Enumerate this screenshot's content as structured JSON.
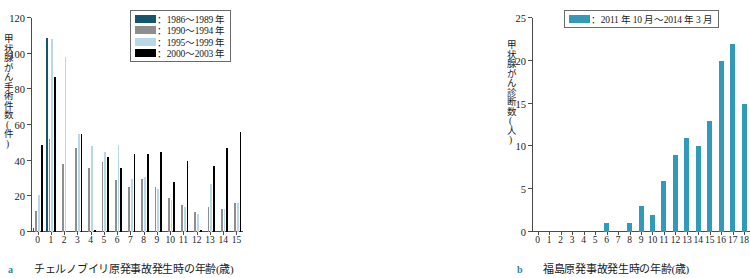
{
  "figure": {
    "panels": [
      {
        "tag": "a",
        "caption": "チェルノブイリ原発事故発生時の年齢(歳)"
      },
      {
        "tag": "b",
        "caption": "福島原発事故発生時の年齢(歳)"
      }
    ]
  },
  "colors": {
    "series_1986_1989": "#14566b",
    "series_1990_1994": "#8e8e8e",
    "series_1995_1999": "#b9d8e6",
    "series_2000_2003": "#000000",
    "series_fukushima": "#3399bb",
    "axis": "#4a4a4a",
    "panel_tag": "#2f7fa8"
  },
  "chart_data": [
    {
      "type": "bar",
      "panel": "a",
      "title": "",
      "xlabel": "チェルノブイリ原発事故発生時の年齢(歳)",
      "ylabel": "甲状腺がん手術件数(件)",
      "ylim": [
        0,
        120
      ],
      "yticks": [
        0,
        20,
        40,
        60,
        80,
        100,
        120
      ],
      "grid": false,
      "legend_position": "top-right",
      "categories": [
        "0",
        "1",
        "2",
        "3",
        "4",
        "5",
        "6",
        "7",
        "8",
        "9",
        "10",
        "11",
        "12",
        "13",
        "14",
        "15"
      ],
      "series": [
        {
          "name": "：1986〜1989 年",
          "color": "#14566b",
          "values": [
            2,
            109,
            0,
            0,
            0,
            0,
            0,
            0,
            0,
            0,
            0,
            0,
            0,
            0,
            0,
            0
          ]
        },
        {
          "name": "：1990〜1994 年",
          "color": "#8e8e8e",
          "values": [
            12,
            52,
            38,
            47,
            36,
            39,
            29,
            25,
            30,
            25,
            19,
            15,
            11,
            14,
            13,
            16
          ]
        },
        {
          "name": "：1995〜1999 年",
          "color": "#b9d8e6",
          "values": [
            21,
            108,
            98,
            55,
            48,
            45,
            49,
            30,
            31,
            24,
            18,
            14,
            10,
            27,
            13,
            16
          ]
        },
        {
          "name": "：2000〜2003 年",
          "color": "#000000",
          "values": [
            49,
            87,
            0,
            55,
            1,
            42,
            36,
            44,
            44,
            45,
            28,
            40,
            1,
            37,
            47,
            56
          ]
        }
      ]
    },
    {
      "type": "bar",
      "panel": "b",
      "title": "",
      "xlabel": "福島原発事故発生時の年齢(歳)",
      "ylabel": "甲状腺がん診断数(人)",
      "ylim": [
        0,
        25
      ],
      "yticks": [
        0,
        5,
        10,
        15,
        20,
        25
      ],
      "grid": false,
      "legend_position": "top-left",
      "categories": [
        "0",
        "1",
        "2",
        "3",
        "4",
        "5",
        "6",
        "7",
        "8",
        "9",
        "10",
        "11",
        "12",
        "13",
        "14",
        "15",
        "16",
        "17",
        "18"
      ],
      "series": [
        {
          "name": "：2011 年 10 月〜2014 年 3 月",
          "color": "#3399bb",
          "values": [
            0,
            0,
            0,
            0,
            0,
            0,
            1,
            0,
            1,
            3,
            2,
            6,
            9,
            11,
            10,
            13,
            20,
            22,
            15
          ]
        }
      ]
    }
  ]
}
